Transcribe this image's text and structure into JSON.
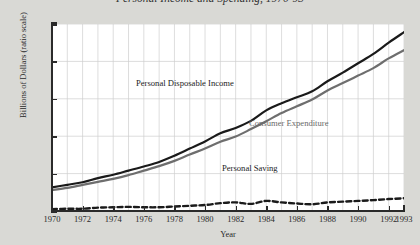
{
  "title": "Personal Income and Spending, 1970-93",
  "axis": {
    "ylabel": "Billions of Dollars (ratio scale)",
    "xlabel": "Year",
    "yticks": [
      "0",
      "100",
      "200",
      "300",
      "400",
      "500"
    ],
    "xticks": [
      "1970",
      "1972",
      "1974",
      "1976",
      "1978",
      "1980",
      "1982",
      "1984",
      "1986",
      "1988",
      "1990",
      "1992",
      "1993"
    ]
  },
  "annotations": {
    "income": "Personal Disposable Income",
    "consumption": "Consumer Expenditure",
    "saving": "Personal Saving"
  },
  "colors": {
    "income": "#1a1a1a",
    "consumption": "#6e6e6e",
    "saving": "#1a1a1a",
    "grid": "#cfcfcf",
    "axis": "#2a2a2a",
    "plot_background": "#ffffff",
    "page_background": "#d9d9d5"
  },
  "chart_data": {
    "type": "line",
    "title": "Personal Income and Spending, 1970-93",
    "xlabel": "Year",
    "ylabel": "Billions of Dollars (ratio scale)",
    "xlim": [
      1970,
      1993
    ],
    "ylim": [
      0,
      500
    ],
    "grid": true,
    "legend": "inline-annotations",
    "x": [
      1970,
      1971,
      1972,
      1973,
      1974,
      1975,
      1976,
      1977,
      1978,
      1979,
      1980,
      1981,
      1982,
      1983,
      1984,
      1985,
      1986,
      1987,
      1988,
      1989,
      1990,
      1991,
      1992,
      1993
    ],
    "series": [
      {
        "name": "Personal Disposable Income",
        "style": "solid",
        "color": "#1a1a1a",
        "values": [
          63,
          70,
          77,
          88,
          97,
          108,
          119,
          131,
          148,
          167,
          186,
          208,
          222,
          241,
          269,
          288,
          304,
          320,
          347,
          370,
          395,
          420,
          450,
          478
        ]
      },
      {
        "name": "Consumer Expenditure",
        "style": "solid",
        "color": "#6e6e6e",
        "values": [
          56,
          62,
          70,
          78,
          86,
          96,
          108,
          120,
          134,
          151,
          167,
          185,
          199,
          219,
          240,
          262,
          280,
          298,
          322,
          342,
          362,
          382,
          408,
          430
        ]
      },
      {
        "name": "Personal Saving",
        "style": "dashed",
        "color": "#1a1a1a",
        "values": [
          5,
          6,
          6,
          9,
          10,
          11,
          10,
          10,
          12,
          14,
          16,
          21,
          23,
          19,
          27,
          23,
          20,
          18,
          23,
          25,
          27,
          29,
          32,
          34
        ]
      }
    ]
  }
}
